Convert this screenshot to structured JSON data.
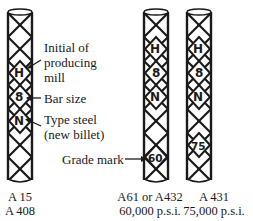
{
  "diagram": {
    "type": "rebar-identification-marks",
    "bars": [
      {
        "id": "bar-a15",
        "marks": [
          "H",
          "8",
          "N"
        ],
        "caption_line1": "A 15",
        "caption_line2": "A 408"
      },
      {
        "id": "bar-a61",
        "marks": [
          "H",
          "8",
          "N",
          "60"
        ],
        "caption_line1": "A61 or A432",
        "caption_line2": "60,000 p.s.i."
      },
      {
        "id": "bar-a431",
        "marks": [
          "H",
          "8",
          "N",
          "75"
        ],
        "caption_line1": "A 431",
        "caption_line2": "75,000 p.s.i."
      }
    ],
    "callouts": {
      "mill": [
        "Initial of",
        "producing",
        "mill"
      ],
      "size": [
        "Bar size"
      ],
      "type": [
        "Type steel",
        "(new billet)"
      ],
      "grade": [
        "Grade mark"
      ]
    },
    "colors": {
      "ink": "#1a1a1a",
      "background": "#ffffff"
    }
  }
}
